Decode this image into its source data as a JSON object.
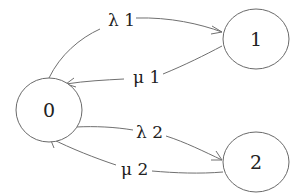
{
  "diagram": {
    "type": "state-transition",
    "nodes": [
      {
        "id": "0",
        "label": "0"
      },
      {
        "id": "1",
        "label": "1"
      },
      {
        "id": "2",
        "label": "2"
      }
    ],
    "edges": [
      {
        "from": "0",
        "to": "1",
        "label": "λ 1"
      },
      {
        "from": "1",
        "to": "0",
        "label": "μ 1"
      },
      {
        "from": "0",
        "to": "2",
        "label": "λ 2"
      },
      {
        "from": "2",
        "to": "0",
        "label": "μ 2"
      }
    ]
  }
}
